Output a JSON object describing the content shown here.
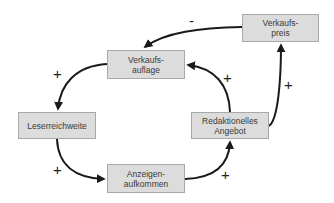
{
  "diagram": {
    "type": "causal-loop",
    "nodes": [
      {
        "id": "verkaufspreis",
        "label": "Verkaufs-\npreis"
      },
      {
        "id": "verkaufsauflage",
        "label": "Verkaufs-\nauflage"
      },
      {
        "id": "leserreichweite",
        "label": "Leserreichweite"
      },
      {
        "id": "redaktionelles_angebot",
        "label": "Redaktionelles\nAngebot"
      },
      {
        "id": "anzeigenaufkommen",
        "label": "Anzeigen-\naufkommen"
      }
    ],
    "edges": [
      {
        "from": "verkaufspreis",
        "to": "verkaufsauflage",
        "sign": "-"
      },
      {
        "from": "verkaufsauflage",
        "to": "leserreichweite",
        "sign": "+"
      },
      {
        "from": "leserreichweite",
        "to": "anzeigenaufkommen",
        "sign": "+"
      },
      {
        "from": "anzeigenaufkommen",
        "to": "redaktionelles_angebot",
        "sign": "+"
      },
      {
        "from": "redaktionelles_angebot",
        "to": "verkaufsauflage",
        "sign": "+"
      },
      {
        "from": "redaktionelles_angebot",
        "to": "verkaufspreis",
        "sign": "+"
      }
    ],
    "colors": {
      "box_fill": "#dcdcdc",
      "box_border": "#a8a8a8",
      "arrow": "#1a1a1a"
    }
  }
}
